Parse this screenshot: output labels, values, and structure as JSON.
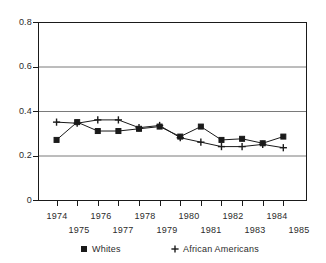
{
  "chart_data": {
    "type": "line",
    "title": "",
    "subtitle": "",
    "xlabel": "",
    "ylabel": "",
    "x": [
      1974,
      1975,
      1976,
      1977,
      1978,
      1979,
      1980,
      1981,
      1982,
      1983,
      1984,
      1985
    ],
    "xtick_labels": [
      "1974",
      "1975",
      "1976",
      "1977",
      "1978",
      "1979",
      "1980",
      "1981",
      "1982",
      "1983",
      "1984",
      "1985"
    ],
    "ytick_labels": [
      "0.8",
      "0.6",
      "0.4",
      "0.2",
      "0"
    ],
    "ytick_values": [
      0.8,
      0.6,
      0.4,
      0.2,
      0
    ],
    "xlim": [
      1973.1,
      1986.1
    ],
    "ylim": [
      0,
      0.8
    ],
    "grid": "horizontal",
    "legend_position": "below-axis",
    "series": [
      {
        "name": "Whites",
        "marker": "filled-square",
        "color": "#1a1a1a",
        "values": [
          0.27,
          0.35,
          0.31,
          0.31,
          0.32,
          0.33,
          0.285,
          0.33,
          0.27,
          0.275,
          0.255,
          0.285
        ]
      },
      {
        "name": "African Americans",
        "marker": "plus",
        "color": "#1a1a1a",
        "values": [
          0.35,
          0.345,
          0.36,
          0.36,
          0.325,
          0.335,
          0.28,
          0.26,
          0.24,
          0.24,
          0.25,
          0.235
        ]
      }
    ]
  },
  "axis": {
    "y_labels": [
      "0.8",
      "0.6",
      "0.4",
      "0.2",
      "0"
    ],
    "x_labels_top": [
      "1974",
      "1976",
      "1978",
      "1980",
      "1982",
      "1984"
    ],
    "x_labels_bottom": [
      "1975",
      "1977",
      "1979",
      "1981",
      "1983",
      "1985"
    ]
  },
  "legend": {
    "entries": [
      {
        "label": "Whites",
        "marker": "filled-square"
      },
      {
        "label": "African Americans",
        "marker": "plus"
      }
    ]
  }
}
